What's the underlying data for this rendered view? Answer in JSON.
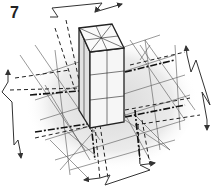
{
  "figure": {
    "label": "7",
    "type": "isometric column diagram",
    "colors": {
      "line": "#333333",
      "grid": "#555555",
      "shade": "#e6e6e6",
      "background": "#ffffff"
    },
    "elements": [
      "column-box",
      "floor-grid",
      "dashed-axis-lines",
      "zigzag-dimension-arrow-top",
      "zigzag-dimension-arrow-right",
      "zigzag-dimension-arrow-left",
      "zigzag-dimension-arrow-bottom"
    ]
  }
}
